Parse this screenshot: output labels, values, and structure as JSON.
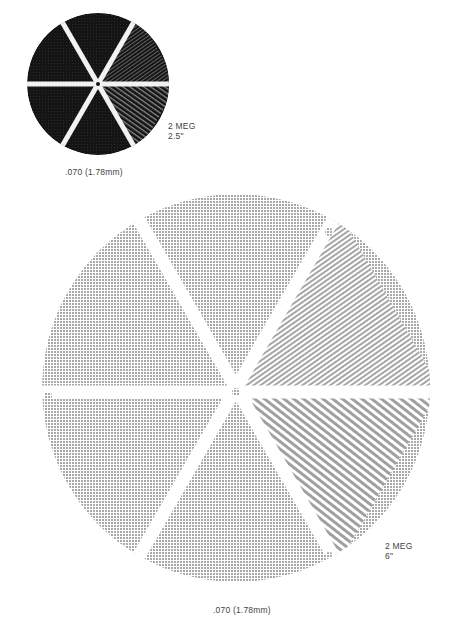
{
  "figure": {
    "small_disk": {
      "spec_line1": "2 MEG",
      "spec_line2": "2.5\"",
      "dimension": ".070 (1.78mm)",
      "fill_color": "#141414",
      "spoke_color": "#f2f2f2"
    },
    "large_disk": {
      "spec_line1": "2 MEG",
      "spec_line2": "6\"",
      "dimension": ".070 (1.78mm)",
      "fill_color": "#bdbdbd",
      "spoke_color": "#ffffff"
    }
  }
}
